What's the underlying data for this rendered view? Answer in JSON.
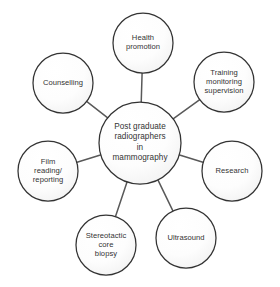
{
  "diagram": {
    "type": "hub-and-spoke",
    "background_color": "#ffffff",
    "circle_stroke_color": "#333333",
    "circle_fill_color": "#fbfbfb",
    "connector_color": "#595959",
    "text_color": "#333333",
    "center": {
      "id": "center-node",
      "label": "Post graduate\nradiographers\nin\nmammography",
      "cx": 140,
      "cy": 143,
      "r": 41
    },
    "satellites": [
      {
        "id": "health-promotion",
        "label": "Health\npromotion",
        "cx": 143,
        "cy": 43,
        "r": 30
      },
      {
        "id": "training-monitoring-supervision",
        "label": "Training\nmonitoring\nsupervision",
        "cx": 224,
        "cy": 82,
        "r": 30
      },
      {
        "id": "research",
        "label": "Research",
        "cx": 232,
        "cy": 171,
        "r": 30
      },
      {
        "id": "ultrasound",
        "label": "Ultrasound",
        "cx": 186,
        "cy": 238,
        "r": 30
      },
      {
        "id": "stereotactic-core-biopsy",
        "label": "Stereotactic\ncore\nbiopsy",
        "cx": 106,
        "cy": 245,
        "r": 30
      },
      {
        "id": "film-reading-reporting",
        "label": "Film\nreading/\nreporting",
        "cx": 48,
        "cy": 171,
        "r": 30
      },
      {
        "id": "counselling",
        "label": "Counselling",
        "cx": 63,
        "cy": 83,
        "r": 30
      }
    ]
  }
}
